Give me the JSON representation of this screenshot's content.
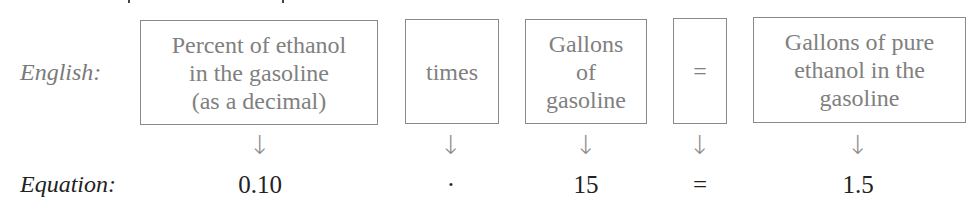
{
  "rows": {
    "english_label": "English:",
    "equation_label": "Equation:"
  },
  "boxes": [
    {
      "text": "Percent of ethanol\nin the gasoline\n(as a decimal)"
    },
    {
      "text": "times"
    },
    {
      "text": "Gallons\nof\ngasoline"
    },
    {
      "text": "="
    },
    {
      "text": "Gallons of pure\nethanol in the\ngasoline"
    }
  ],
  "arrows": [
    "↓",
    "↓",
    "↓",
    "↓",
    "↓"
  ],
  "equation": [
    "0.10",
    "·",
    "15",
    "=",
    "1.5"
  ],
  "colors": {
    "english_text": "#7a7a7a",
    "equation_text": "#222222",
    "box_border": "#8a8a8a"
  }
}
